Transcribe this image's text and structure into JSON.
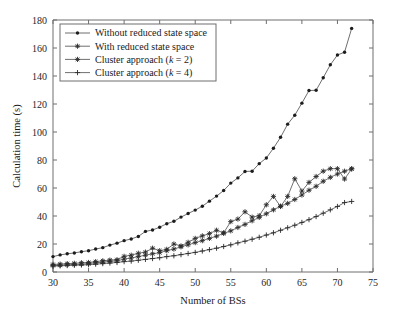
{
  "chart_data": {
    "type": "line",
    "title": "",
    "xlabel": "Number of BSs",
    "ylabel": "Calculation time (s)",
    "xlim": [
      30,
      75
    ],
    "ylim": [
      0,
      180
    ],
    "xticks": [
      30,
      35,
      40,
      45,
      50,
      55,
      60,
      65,
      70,
      75
    ],
    "yticks": [
      0,
      20,
      40,
      60,
      80,
      100,
      120,
      140,
      160,
      180
    ],
    "grid": false,
    "legend_position": "upper-left",
    "x": [
      30,
      31,
      32,
      33,
      34,
      35,
      36,
      37,
      38,
      39,
      40,
      41,
      42,
      43,
      44,
      45,
      46,
      47,
      48,
      49,
      50,
      51,
      52,
      53,
      54,
      55,
      56,
      57,
      58,
      59,
      60,
      61,
      62,
      63,
      64,
      65,
      66,
      67,
      68,
      69,
      70,
      71,
      72
    ],
    "series": [
      {
        "name": "Without reduced state space",
        "marker": "dot",
        "values": [
          11.0,
          12.2,
          13.0,
          13.6,
          14.5,
          15.2,
          16.4,
          17.4,
          19.2,
          20.6,
          22.4,
          23.6,
          25.4,
          29.0,
          30.0,
          32.0,
          34.5,
          36.2,
          39.2,
          41.8,
          44.2,
          47.0,
          50.6,
          54.2,
          58.2,
          63.5,
          67.2,
          71.8,
          72.0,
          77.4,
          81.4,
          88.4,
          96.2,
          105.6,
          112.0,
          120.6,
          129.6,
          129.8,
          138.8,
          148.0,
          155.0,
          157.0,
          174.0
        ]
      },
      {
        "name": "With reduced state space",
        "marker": "star",
        "values": [
          5.4,
          5.6,
          6.0,
          6.2,
          6.6,
          6.8,
          7.4,
          8.0,
          8.5,
          8.8,
          11.2,
          12.0,
          13.4,
          14.2,
          17.0,
          15.2,
          16.2,
          20.0,
          18.6,
          21.2,
          24.0,
          25.8,
          27.4,
          29.8,
          28.0,
          36.0,
          37.8,
          43.0,
          39.2,
          40.2,
          48.0,
          54.0,
          46.8,
          54.0,
          66.6,
          57.8,
          64.0,
          68.2,
          72.0,
          73.8,
          73.8,
          66.4,
          73.6
        ]
      },
      {
        "name": "Cluster approach (k = 2)",
        "marker": "asterisk",
        "values": [
          4.6,
          4.8,
          5.2,
          5.4,
          5.6,
          6.0,
          6.6,
          7.0,
          7.6,
          8.0,
          9.2,
          10.0,
          11.0,
          12.0,
          13.0,
          13.8,
          15.2,
          16.4,
          18.0,
          19.4,
          21.0,
          22.4,
          24.0,
          25.6,
          27.6,
          29.4,
          31.8,
          34.0,
          36.6,
          39.0,
          41.6,
          44.4,
          47.0,
          49.0,
          51.8,
          55.0,
          58.4,
          61.2,
          64.8,
          67.6,
          70.0,
          72.0,
          73.8
        ]
      },
      {
        "name": "Cluster approach (k = 4)",
        "marker": "plus",
        "values": [
          4.2,
          4.4,
          4.6,
          4.8,
          5.0,
          5.2,
          5.6,
          6.0,
          6.4,
          6.8,
          7.4,
          7.8,
          8.4,
          9.0,
          9.6,
          10.2,
          11.0,
          11.6,
          12.4,
          13.2,
          14.0,
          15.0,
          16.0,
          17.0,
          18.2,
          19.4,
          20.8,
          22.0,
          23.4,
          24.8,
          26.4,
          28.0,
          29.8,
          31.6,
          33.4,
          35.4,
          37.4,
          39.6,
          42.0,
          44.4,
          46.8,
          49.6,
          50.4
        ]
      }
    ],
    "legend": [
      {
        "label": "Without reduced state space",
        "marker": "dot",
        "italic_part": "",
        "plain_tail": ""
      },
      {
        "label": "With reduced state space",
        "marker": "star",
        "italic_part": "",
        "plain_tail": ""
      },
      {
        "label": "Cluster approach (",
        "marker": "asterisk",
        "italic_part": "k",
        "plain_tail": " = 2)"
      },
      {
        "label": "Cluster approach (",
        "marker": "plus",
        "italic_part": "k",
        "plain_tail": " = 4)"
      }
    ]
  },
  "colors": {
    "background": "#ffffff",
    "axis": "#6e6e6e",
    "line": "#4a4a4a",
    "marker": "#2b2b2b",
    "text": "#1a1a1a"
  }
}
